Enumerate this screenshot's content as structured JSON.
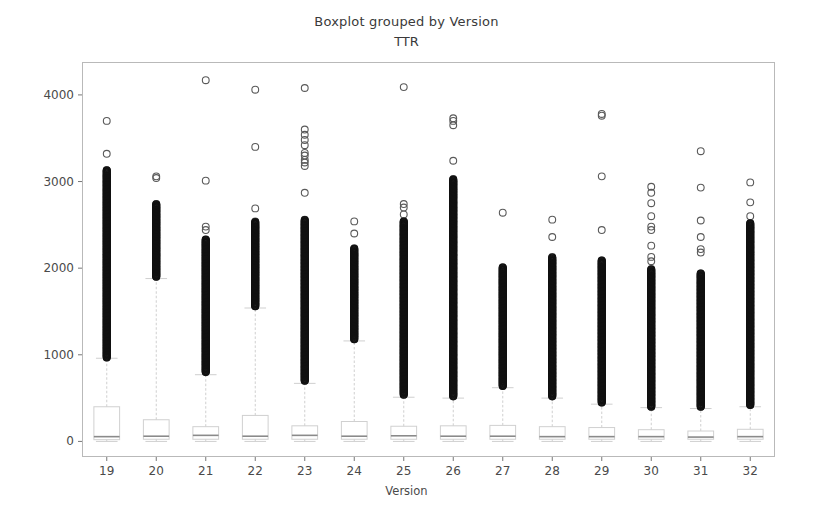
{
  "chart": {
    "title": "Boxplot grouped by Version",
    "subtitle": "TTR",
    "xlabel": "Version",
    "ylabel": ""
  },
  "chart_data": {
    "type": "box",
    "title": "Boxplot grouped by Version",
    "subtitle": "TTR",
    "xlabel": "Version",
    "ylabel": "TTR",
    "grid": false,
    "legend": null,
    "ylim": [
      -180,
      4380
    ],
    "xlim": [
      0.5,
      14.5
    ],
    "yticks": [
      0,
      1000,
      2000,
      3000,
      4000
    ],
    "ytick_labels": [
      "0",
      "1000",
      "2000",
      "3000",
      "4000"
    ],
    "categories": [
      "19",
      "20",
      "21",
      "22",
      "23",
      "24",
      "25",
      "26",
      "27",
      "28",
      "29",
      "30",
      "31",
      "32"
    ],
    "xtick_labels": [
      "19",
      "20",
      "21",
      "22",
      "23",
      "24",
      "25",
      "26",
      "27",
      "28",
      "29",
      "30",
      "31",
      "32"
    ],
    "boxes": [
      {
        "category": "19",
        "q1": 20,
        "median": 55,
        "q3": 400,
        "whisker_low": 0,
        "whisker_high": 960,
        "outliers": [
          3700,
          3320,
          3130,
          3060,
          3000,
          2950,
          2900,
          2860,
          2820,
          2790,
          2760,
          2730,
          2700,
          2670,
          2640,
          2610,
          2580,
          2550,
          2520,
          2490,
          2460,
          2430,
          2400,
          2370,
          2340,
          2310,
          2280,
          2250,
          2220,
          2190,
          2160,
          2130,
          2100,
          2070,
          2040,
          2010,
          1980,
          1950,
          1920,
          1890,
          1860,
          1830,
          1800,
          1770,
          1740,
          1710,
          1680,
          1650,
          1620,
          1590,
          1560,
          1530,
          1500,
          1470,
          1440,
          1410,
          1380,
          1350,
          1320,
          1290,
          1260,
          1230,
          1200,
          1170,
          1140,
          1110,
          1080,
          1050,
          1020,
          990,
          970
        ]
      },
      {
        "category": "20",
        "q1": 25,
        "median": 60,
        "q3": 250,
        "whisker_low": 0,
        "whisker_high": 1880,
        "outliers": [
          3060,
          3040,
          2740,
          2700,
          2660,
          2620,
          2590,
          2560,
          2530,
          2500,
          2470,
          2440,
          2410,
          2380,
          2350,
          2320,
          2290,
          2260,
          2230,
          2200,
          2170,
          2140,
          2110,
          2080,
          2050,
          2020,
          1990,
          1960,
          1930,
          1900
        ]
      },
      {
        "category": "21",
        "q1": 25,
        "median": 70,
        "q3": 170,
        "whisker_low": 0,
        "whisker_high": 770,
        "outliers": [
          4170,
          3010,
          2480,
          2440,
          2330,
          2300,
          2270,
          2240,
          2210,
          2180,
          2150,
          2120,
          2090,
          2060,
          2030,
          2000,
          1970,
          1940,
          1910,
          1880,
          1850,
          1820,
          1790,
          1760,
          1730,
          1700,
          1670,
          1640,
          1610,
          1580,
          1550,
          1520,
          1490,
          1460,
          1430,
          1400,
          1370,
          1340,
          1310,
          1280,
          1250,
          1220,
          1190,
          1160,
          1130,
          1100,
          1070,
          1040,
          1010,
          980,
          950,
          920,
          890,
          860,
          830,
          800
        ]
      },
      {
        "category": "22",
        "q1": 25,
        "median": 60,
        "q3": 300,
        "whisker_low": 0,
        "whisker_high": 1540,
        "outliers": [
          4060,
          3400,
          2690,
          2540,
          2470,
          2430,
          2400,
          2370,
          2340,
          2310,
          2280,
          2250,
          2220,
          2190,
          2160,
          2130,
          2100,
          2070,
          2040,
          2010,
          1980,
          1950,
          1920,
          1890,
          1860,
          1830,
          1800,
          1770,
          1740,
          1710,
          1680,
          1650,
          1620,
          1590,
          1560
        ]
      },
      {
        "category": "23",
        "q1": 25,
        "median": 70,
        "q3": 180,
        "whisker_low": 0,
        "whisker_high": 670,
        "outliers": [
          4080,
          3600,
          3540,
          3480,
          3420,
          3330,
          3300,
          3250,
          3220,
          3180,
          2870,
          2560,
          2500,
          2460,
          2420,
          2380,
          2340,
          2300,
          2260,
          2220,
          2180,
          2140,
          2100,
          2060,
          2020,
          1980,
          1940,
          1900,
          1860,
          1820,
          1780,
          1740,
          1700,
          1660,
          1620,
          1580,
          1540,
          1500,
          1460,
          1420,
          1380,
          1340,
          1300,
          1260,
          1220,
          1180,
          1140,
          1100,
          1060,
          1020,
          980,
          940,
          900,
          860,
          820,
          780,
          740,
          700
        ]
      },
      {
        "category": "24",
        "q1": 25,
        "median": 60,
        "q3": 230,
        "whisker_low": 0,
        "whisker_high": 1160,
        "outliers": [
          2540,
          2400,
          2230,
          2170,
          2140,
          2110,
          2080,
          2050,
          2020,
          1990,
          1960,
          1930,
          1900,
          1870,
          1840,
          1810,
          1780,
          1750,
          1720,
          1690,
          1660,
          1630,
          1600,
          1570,
          1540,
          1510,
          1480,
          1450,
          1420,
          1390,
          1360,
          1330,
          1300,
          1270,
          1240,
          1210,
          1180
        ]
      },
      {
        "category": "25",
        "q1": 25,
        "median": 65,
        "q3": 175,
        "whisker_low": 0,
        "whisker_high": 510,
        "outliers": [
          4090,
          2740,
          2700,
          2620,
          2540,
          2490,
          2440,
          2390,
          2340,
          2300,
          2260,
          2220,
          2180,
          2140,
          2100,
          2060,
          2020,
          1980,
          1940,
          1900,
          1860,
          1820,
          1780,
          1740,
          1700,
          1660,
          1620,
          1580,
          1540,
          1500,
          1460,
          1420,
          1380,
          1340,
          1300,
          1260,
          1220,
          1180,
          1140,
          1100,
          1060,
          1020,
          980,
          940,
          900,
          860,
          820,
          780,
          740,
          700,
          660,
          620,
          580,
          540
        ]
      },
      {
        "category": "26",
        "q1": 25,
        "median": 60,
        "q3": 180,
        "whisker_low": 0,
        "whisker_high": 500,
        "outliers": [
          3730,
          3700,
          3650,
          3240,
          3030,
          3000,
          2970,
          2940,
          2910,
          2880,
          2850,
          2820,
          2760,
          2700,
          2660,
          2620,
          2580,
          2540,
          2480,
          2420,
          2360,
          2300,
          2250,
          2200,
          2150,
          2100,
          2050,
          2000,
          1950,
          1900,
          1850,
          1800,
          1750,
          1700,
          1650,
          1600,
          1550,
          1500,
          1450,
          1400,
          1350,
          1300,
          1250,
          1200,
          1150,
          1100,
          1050,
          1000,
          950,
          900,
          850,
          800,
          750,
          700,
          650,
          600,
          550,
          520
        ]
      },
      {
        "category": "27",
        "q1": 25,
        "median": 60,
        "q3": 185,
        "whisker_low": 0,
        "whisker_high": 620,
        "outliers": [
          2640,
          2010,
          1960,
          1930,
          1900,
          1870,
          1840,
          1810,
          1780,
          1750,
          1720,
          1690,
          1660,
          1630,
          1600,
          1570,
          1540,
          1510,
          1480,
          1450,
          1420,
          1390,
          1360,
          1330,
          1300,
          1270,
          1240,
          1210,
          1180,
          1150,
          1120,
          1090,
          1060,
          1030,
          1000,
          970,
          940,
          910,
          880,
          850,
          820,
          790,
          760,
          730,
          700,
          670,
          640
        ]
      },
      {
        "category": "28",
        "q1": 25,
        "median": 55,
        "q3": 170,
        "whisker_low": 0,
        "whisker_high": 500,
        "outliers": [
          2560,
          2360,
          2130,
          2090,
          2060,
          2020,
          1990,
          1950,
          1910,
          1870,
          1830,
          1790,
          1750,
          1710,
          1670,
          1630,
          1590,
          1550,
          1510,
          1470,
          1430,
          1390,
          1350,
          1310,
          1270,
          1230,
          1190,
          1150,
          1110,
          1070,
          1030,
          990,
          950,
          910,
          870,
          830,
          790,
          750,
          710,
          670,
          630,
          590,
          550,
          520
        ]
      },
      {
        "category": "29",
        "q1": 25,
        "median": 55,
        "q3": 160,
        "whisker_low": 0,
        "whisker_high": 430,
        "outliers": [
          3780,
          3760,
          3060,
          2440,
          2090,
          2050,
          2010,
          1970,
          1930,
          1890,
          1850,
          1810,
          1770,
          1730,
          1690,
          1650,
          1610,
          1570,
          1530,
          1490,
          1450,
          1410,
          1370,
          1330,
          1290,
          1250,
          1210,
          1170,
          1130,
          1090,
          1050,
          1010,
          970,
          930,
          890,
          850,
          810,
          770,
          730,
          690,
          650,
          610,
          570,
          530,
          490,
          450
        ]
      },
      {
        "category": "30",
        "q1": 25,
        "median": 55,
        "q3": 135,
        "whisker_low": 0,
        "whisker_high": 390,
        "outliers": [
          2940,
          2870,
          2750,
          2600,
          2480,
          2440,
          2260,
          2130,
          2080,
          1990,
          1940,
          1900,
          1860,
          1820,
          1780,
          1740,
          1700,
          1660,
          1620,
          1580,
          1540,
          1500,
          1460,
          1420,
          1380,
          1340,
          1300,
          1260,
          1220,
          1180,
          1140,
          1100,
          1060,
          1020,
          980,
          940,
          900,
          860,
          820,
          780,
          740,
          700,
          660,
          620,
          580,
          540,
          500,
          460,
          420,
          400
        ]
      },
      {
        "category": "31",
        "q1": 25,
        "median": 50,
        "q3": 120,
        "whisker_low": 0,
        "whisker_high": 380,
        "outliers": [
          3350,
          2930,
          2550,
          2360,
          2220,
          2180,
          1940,
          1900,
          1830,
          1790,
          1750,
          1710,
          1670,
          1630,
          1590,
          1550,
          1510,
          1470,
          1430,
          1390,
          1350,
          1310,
          1270,
          1230,
          1190,
          1150,
          1110,
          1070,
          1030,
          990,
          950,
          910,
          870,
          830,
          790,
          750,
          710,
          670,
          630,
          590,
          550,
          510,
          470,
          430,
          400
        ]
      },
      {
        "category": "32",
        "q1": 25,
        "median": 55,
        "q3": 140,
        "whisker_low": 0,
        "whisker_high": 400,
        "outliers": [
          2990,
          2760,
          2600,
          2520,
          2470,
          2420,
          2360,
          2300,
          2240,
          2180,
          2130,
          2090,
          2050,
          2010,
          1970,
          1930,
          1890,
          1850,
          1810,
          1770,
          1730,
          1690,
          1650,
          1610,
          1570,
          1530,
          1490,
          1450,
          1410,
          1370,
          1330,
          1290,
          1250,
          1210,
          1170,
          1130,
          1090,
          1050,
          1010,
          970,
          930,
          890,
          850,
          810,
          770,
          730,
          690,
          650,
          610,
          570,
          530,
          490,
          450,
          420
        ]
      }
    ]
  },
  "colors": {
    "background": "#ffffff",
    "frame": "#b9b9b9",
    "box_line": "#d0d0d0",
    "whisker": "#cfcfcf",
    "outlier": "#5a5a5a",
    "text": "#4a4a4a"
  }
}
